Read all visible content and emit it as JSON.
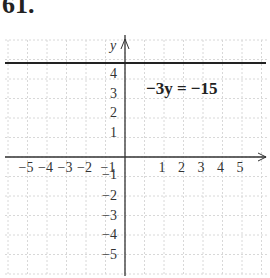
{
  "problem": {
    "number": "61."
  },
  "chart_data": {
    "type": "line",
    "title": "",
    "equation": "−3y = −15",
    "xlabel": "x",
    "ylabel": "y",
    "xlim": [
      -6,
      7
    ],
    "ylim": [
      -6,
      5.5
    ],
    "grid": true,
    "x_ticks": [
      "−5",
      "−4",
      "−3",
      "−2",
      "−1",
      "1",
      "2",
      "3",
      "4",
      "5"
    ],
    "y_ticks": [
      "4",
      "3",
      "2",
      "1",
      "−1",
      "−2",
      "−3",
      "−4",
      "−5"
    ],
    "series": [
      {
        "name": "−3y = −15",
        "kind": "horizontal_line",
        "y": 5,
        "x": [
          -6,
          7
        ],
        "values": [
          5,
          5
        ]
      }
    ]
  }
}
